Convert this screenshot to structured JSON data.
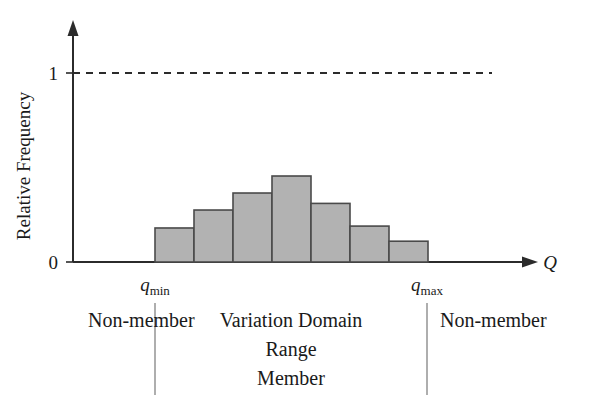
{
  "chart_data": {
    "type": "bar",
    "title": "",
    "subtitle": "",
    "xlabel": "Q",
    "ylabel": "Relative Frequency",
    "ylim": [
      0,
      1.08
    ],
    "xlim": [
      0,
      1
    ],
    "grid": false,
    "legend": null,
    "y_ticks": [
      "0",
      "1"
    ],
    "y_tick_values": [
      0,
      1
    ],
    "x_ticks": [
      "q_min",
      "q_max"
    ],
    "categories": [
      "b1",
      "b2",
      "b3",
      "b4",
      "b5",
      "b6",
      "b7"
    ],
    "values": [
      0.18,
      0.275,
      0.365,
      0.455,
      0.31,
      0.19,
      0.11
    ],
    "bar_fill_color": "#b2b2b2",
    "bar_edge_color": "#4a4a4a",
    "annotations": [
      "Non-member",
      "Variation Domain",
      "Range",
      "Member",
      "Non-member"
    ],
    "reference_line": {
      "axis": "y",
      "value": 1,
      "style": "dashed",
      "label": "1"
    }
  },
  "axes": {
    "y_label": "Relative Frequency",
    "y_tick_zero": "0",
    "y_tick_one": "1",
    "x_axis_label": "Q"
  },
  "x_markers": {
    "min": {
      "base": "q",
      "sub": "min"
    },
    "max": {
      "base": "q",
      "sub": "max"
    }
  },
  "regions": {
    "left": {
      "label": "Non-member"
    },
    "middle": {
      "line1": "Variation Domain",
      "line2": "Range",
      "line3": "Member"
    },
    "right": {
      "label": "Non-member"
    }
  },
  "colors": {
    "bar_fill": "#b2b2b2",
    "bar_edge": "#4a4a4a",
    "axis": "#2b2b2b",
    "divider": "#9a9a9a",
    "background": "#ffffff"
  }
}
